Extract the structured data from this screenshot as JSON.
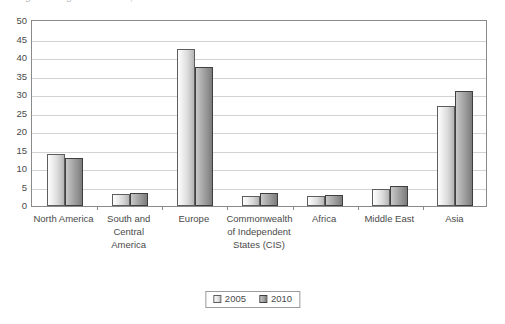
{
  "chart_data": {
    "type": "bar",
    "title": "",
    "xlabel": "",
    "ylabel": "",
    "ylim": [
      0,
      50
    ],
    "ytick_step": 5,
    "yticks": [
      "50",
      "45",
      "40",
      "35",
      "30",
      "25",
      "20",
      "15",
      "10",
      "5",
      "0"
    ],
    "grid": true,
    "legend_position": "bottom",
    "categories": [
      "North America",
      "South and\nCentral\nAmerica",
      "Europe",
      "Commonwealth\nof Independent\nStates (CIS)",
      "Africa",
      "Middle East",
      "Asia"
    ],
    "series": [
      {
        "name": "2005",
        "color": "#e2e2e2",
        "values": [
          14,
          3.3,
          42.5,
          2.8,
          2.8,
          4.5,
          27
        ]
      },
      {
        "name": "2010",
        "color": "#9c9c9c",
        "values": [
          13,
          3.4,
          37.5,
          3.6,
          2.9,
          5.5,
          31
        ]
      }
    ]
  },
  "header": {
    "cropped_title": "Figure: Regional shares, 2005 and 2010"
  },
  "legend": {
    "items": [
      {
        "label": "2005"
      },
      {
        "label": "2010"
      }
    ]
  }
}
